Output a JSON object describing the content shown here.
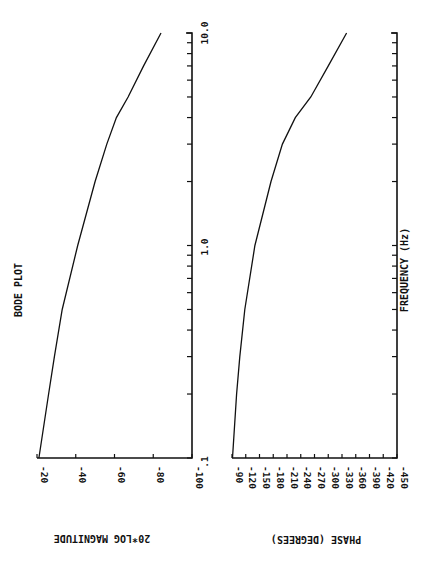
{
  "chart_data": [
    {
      "type": "line",
      "title": "BODE PLOT",
      "orientation": "rotated-90-ccw",
      "xlabel": "FREQUENCY  (Hz)",
      "ylabel": "20*LOG MAGNITUDE",
      "xscale": "log",
      "xlim": [
        0.1,
        10.0
      ],
      "ylim": [
        -100,
        -20
      ],
      "x_tick_labels": [
        ".1",
        "1.0",
        "10.0"
      ],
      "y_ticks": [
        -20,
        -40,
        -60,
        -80,
        -100
      ],
      "y_tick_labels": [
        "-20",
        "-40",
        "-60",
        "-80",
        "-100"
      ],
      "grid": false,
      "series": [
        {
          "name": "Magnitude",
          "x": [
            0.1,
            0.2,
            0.3,
            0.5,
            1.0,
            2.0,
            3.0,
            4.0,
            5.0,
            7.0,
            10.0
          ],
          "values": [
            -21,
            -26,
            -29,
            -33,
            -41,
            -50,
            -56,
            -61,
            -67,
            -75,
            -84
          ]
        }
      ]
    },
    {
      "type": "line",
      "title": "",
      "orientation": "rotated-90-ccw",
      "xlabel": "FREQUENCY  (Hz)",
      "ylabel": "PHASE (DEGREES)",
      "xscale": "log",
      "xlim": [
        0.1,
        10.0
      ],
      "ylim": [
        -450,
        -90
      ],
      "x_tick_labels": [
        ".1",
        "1.0",
        "10.0"
      ],
      "y_ticks": [
        -90,
        -120,
        -150,
        -180,
        -210,
        -240,
        -270,
        -300,
        -330,
        -360,
        -390,
        -420,
        -450
      ],
      "y_tick_labels": [
        "-90",
        "-120",
        "-150",
        "-180",
        "-210",
        "-240",
        "-270",
        "-300",
        "-330",
        "-360",
        "-390",
        "-420",
        "-450"
      ],
      "grid": false,
      "series": [
        {
          "name": "Phase",
          "x": [
            0.1,
            0.2,
            0.3,
            0.5,
            1.0,
            2.0,
            3.0,
            4.0,
            5.0,
            7.0,
            10.0
          ],
          "values": [
            -91,
            -100,
            -107,
            -118,
            -140,
            -175,
            -200,
            -228,
            -262,
            -300,
            -340
          ]
        }
      ]
    }
  ],
  "labels": {
    "title": "BODE PLOT",
    "freq_axis": "FREQUENCY  (Hz)",
    "mag_axis": "20*LOG MAGNITUDE",
    "phase_axis": "PHASE (DEGREES)",
    "freq_low": ".1",
    "freq_mid": "1.0",
    "freq_high": "10.0"
  }
}
